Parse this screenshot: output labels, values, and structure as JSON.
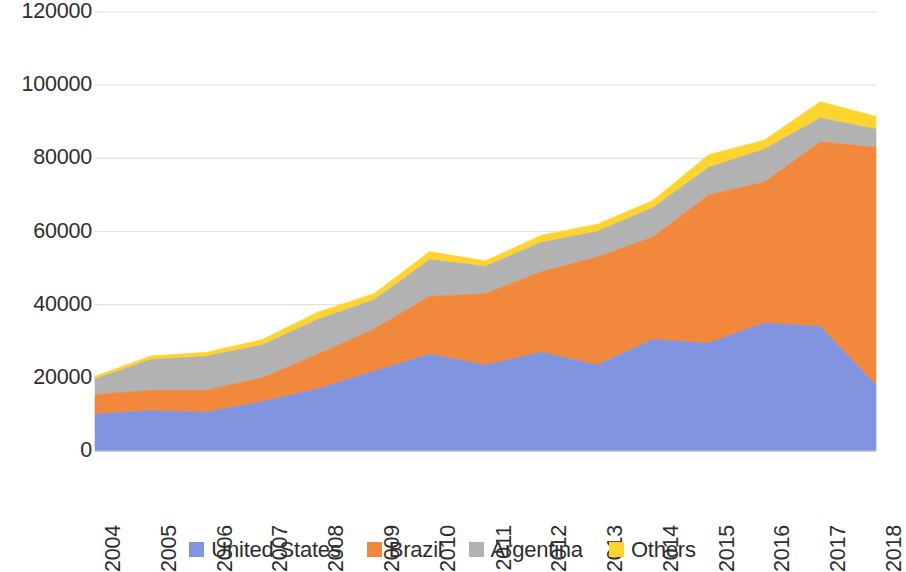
{
  "chart_data": {
    "type": "area",
    "stacked": true,
    "title": "",
    "subtitle": "",
    "xlabel": "",
    "ylabel": "",
    "categories": [
      "2004",
      "2005",
      "2006",
      "2007",
      "2008",
      "2009",
      "2010",
      "2011",
      "2012",
      "2013",
      "2014",
      "2015",
      "2016",
      "2017",
      "2018"
    ],
    "x": [
      2004,
      2005,
      2006,
      2007,
      2008,
      2009,
      2010,
      2011,
      2012,
      2013,
      2014,
      2015,
      2016,
      2017,
      2018
    ],
    "series": [
      {
        "name": "United States",
        "color": "#8094e0",
        "values": [
          10100,
          11000,
          10600,
          13500,
          17000,
          21800,
          26500,
          23500,
          27000,
          23500,
          30500,
          29500,
          35000,
          34000,
          18000
        ]
      },
      {
        "name": "Brazil",
        "color": "#f1883c",
        "values": [
          5300,
          5600,
          6000,
          6500,
          9500,
          11500,
          15800,
          19500,
          22000,
          29500,
          28000,
          40500,
          38500,
          50500,
          65000
        ]
      },
      {
        "name": "Argentina",
        "color": "#b2b2b2",
        "values": [
          4300,
          8400,
          9300,
          9000,
          9500,
          8000,
          10000,
          7500,
          8000,
          7000,
          8000,
          7500,
          9000,
          6500,
          5000
        ]
      },
      {
        "name": "Others",
        "color": "#ffd42e",
        "values": [
          700,
          1000,
          1100,
          1500,
          2000,
          1700,
          2200,
          1500,
          2000,
          2000,
          2000,
          3500,
          2500,
          4500,
          3500
        ]
      }
    ],
    "totals": [
      20400,
      26000,
      27000,
      30500,
      38000,
      43000,
      54500,
      52000,
      59000,
      62000,
      68500,
      81000,
      85000,
      95500,
      91500
    ],
    "ylim": [
      0,
      120000
    ],
    "yticks": [
      0,
      20000,
      40000,
      60000,
      80000,
      100000,
      120000
    ],
    "ytick_labels": [
      "0",
      "20000",
      "40000",
      "60000",
      "80000",
      "100000",
      "120000"
    ],
    "grid": true,
    "legend_position": "bottom"
  },
  "legend": {
    "items": [
      {
        "label": "United States",
        "color": "#8094e0"
      },
      {
        "label": "Brazil",
        "color": "#f1883c"
      },
      {
        "label": "Argentina",
        "color": "#b2b2b2"
      },
      {
        "label": "Others",
        "color": "#ffd42e"
      }
    ]
  },
  "axes": {
    "y_labels": [
      "120000",
      "100000",
      "80000",
      "60000",
      "40000",
      "20000",
      "0"
    ],
    "x_labels": [
      "2004",
      "2005",
      "2006",
      "2007",
      "2008",
      "2009",
      "2010",
      "2011",
      "2012",
      "2013",
      "2014",
      "2015",
      "2016",
      "2017",
      "2018"
    ]
  },
  "colors": {
    "grid": "#e2e2e2",
    "axis_text": "#2e2e2e",
    "background": "#ffffff"
  }
}
